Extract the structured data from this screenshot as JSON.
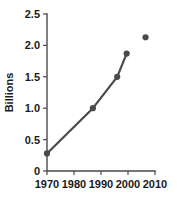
{
  "chart_data": {
    "type": "line",
    "title": "",
    "subtitle": "",
    "xlabel": "",
    "ylabel": "Billions",
    "xlim": [
      1967,
      2012
    ],
    "ylim": [
      0,
      2.5
    ],
    "grid": false,
    "legend": "none",
    "x_ticks": [
      1970,
      1980,
      1990,
      2000,
      2010
    ],
    "x_tick_labels": [
      "1970",
      "1980",
      "1990",
      "2000",
      "2010"
    ],
    "y_ticks": [
      0,
      0.5,
      1.0,
      1.5,
      2.0,
      2.5
    ],
    "y_tick_labels": [
      "0",
      "0.5",
      "1.0",
      "1.5",
      "2.0",
      "2.5"
    ],
    "series": [
      {
        "name": "connected-trend",
        "style": "line-with-markers",
        "color": "#4a4a4a",
        "x": [
          1970,
          1987,
          1996,
          1999.5
        ],
        "values": [
          0.28,
          1.0,
          1.5,
          1.87
        ]
      },
      {
        "name": "isolated-point",
        "style": "marker-only",
        "color": "#4a4a4a",
        "x": [
          2006.5
        ],
        "values": [
          2.13
        ]
      }
    ]
  },
  "axis": {
    "y_title": "Billions"
  },
  "colors": {
    "series": "#4a4a4a",
    "axis": "#4a4a4a",
    "text": "#1a1a1a",
    "background": "#ffffff"
  }
}
